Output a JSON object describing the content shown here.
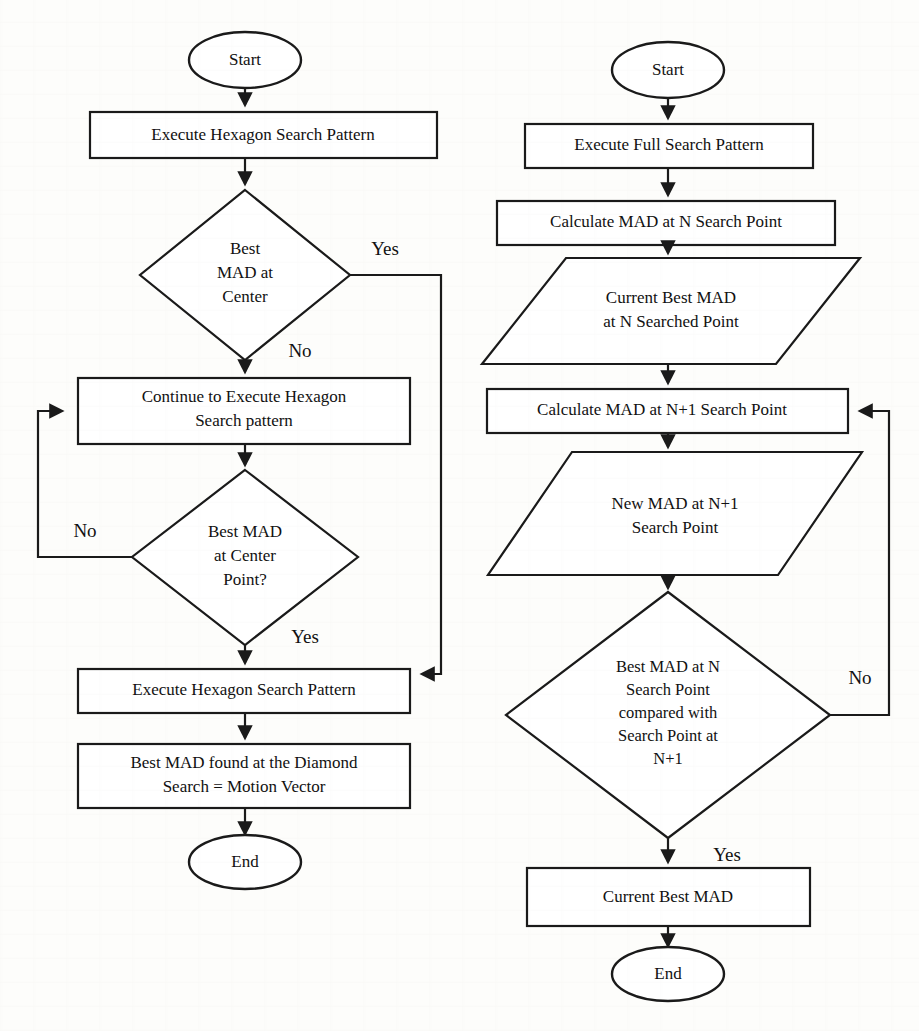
{
  "document": {
    "type": "flowchart-pair",
    "background_color": "#fdfdfb",
    "line_color": "#1a1a1a",
    "shape_fill": "#ffffff"
  },
  "left_flowchart": {
    "name": "Hexagon / Diamond Search Flowchart",
    "nodes": {
      "start": {
        "label": "Start",
        "shape": "terminator"
      },
      "exec_hexagon_1": {
        "label": "Execute Hexagon Search Pattern",
        "shape": "process"
      },
      "decision_1": {
        "line1": "Best",
        "line2": "MAD at",
        "line3": "Center",
        "shape": "decision"
      },
      "continue_hexagon": {
        "line1": "Continue to Execute Hexagon",
        "line2": "Search pattern",
        "shape": "process"
      },
      "decision_2": {
        "line1": "Best MAD",
        "line2": "at Center",
        "line3": "Point?",
        "shape": "decision"
      },
      "exec_hexagon_2": {
        "label": "Execute Hexagon Search Pattern",
        "shape": "process"
      },
      "best_mad_found": {
        "line1": "Best MAD found at the Diamond",
        "line2": "Search = Motion Vector",
        "shape": "process"
      },
      "end": {
        "label": "End",
        "shape": "terminator"
      }
    },
    "edge_labels": {
      "d1_yes": "Yes",
      "d1_no": "No",
      "d2_no": "No",
      "d2_yes": "Yes"
    }
  },
  "right_flowchart": {
    "name": "Full Search Flowchart",
    "nodes": {
      "start": {
        "label": "Start",
        "shape": "terminator"
      },
      "exec_full_search": {
        "label": "Execute Full Search Pattern",
        "shape": "process"
      },
      "calc_mad_n": {
        "label": "Calculate MAD at N Search Point",
        "shape": "process"
      },
      "current_best_mad_n": {
        "line1": "Current Best MAD",
        "line2": "at N Searched Point",
        "shape": "data"
      },
      "calc_mad_n1": {
        "label": "Calculate MAD at N+1 Search Point",
        "shape": "process"
      },
      "new_mad_n1": {
        "line1": "New MAD at N+1",
        "line2": "Search Point",
        "shape": "data"
      },
      "decision": {
        "line1": "Best MAD at N",
        "line2": "Search Point",
        "line3": "compared with",
        "line4": "Search Point at",
        "line5": "N+1",
        "shape": "decision"
      },
      "current_best_mad": {
        "label": "Current Best MAD",
        "shape": "process"
      },
      "end": {
        "label": "End",
        "shape": "terminator"
      }
    },
    "edge_labels": {
      "d_no": "No",
      "d_yes": "Yes"
    }
  }
}
